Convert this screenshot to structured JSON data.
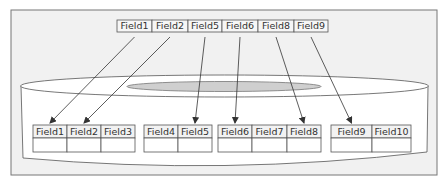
{
  "colors": {
    "frame_fill": "#f1f1f1",
    "frame_stroke": "#777777",
    "cylinder_fill": "#ffffff",
    "inner_ellipse_fill": "#cfcfcf",
    "table_stroke": "#555555",
    "header_fill": "#f2f2f2",
    "arrow": "#333333"
  },
  "source_record": {
    "fields": [
      "Field1",
      "Field2",
      "Field5",
      "Field6",
      "Field8",
      "Field9"
    ]
  },
  "target_tables": [
    {
      "fields": [
        "Field1",
        "Field2",
        "Field3"
      ]
    },
    {
      "fields": [
        "Field4",
        "Field5"
      ]
    },
    {
      "fields": [
        "Field6",
        "Field7",
        "Field8"
      ]
    },
    {
      "fields": [
        "Field9",
        "Field10"
      ]
    }
  ],
  "mappings": [
    {
      "from": "Field1",
      "to_table": 0,
      "to_field": "Field1"
    },
    {
      "from": "Field2",
      "to_table": 0,
      "to_field": "Field2"
    },
    {
      "from": "Field5",
      "to_table": 1,
      "to_field": "Field5"
    },
    {
      "from": "Field6",
      "to_table": 2,
      "to_field": "Field6"
    },
    {
      "from": "Field8",
      "to_table": 2,
      "to_field": "Field8"
    },
    {
      "from": "Field9",
      "to_table": 3,
      "to_field": "Field9"
    }
  ]
}
